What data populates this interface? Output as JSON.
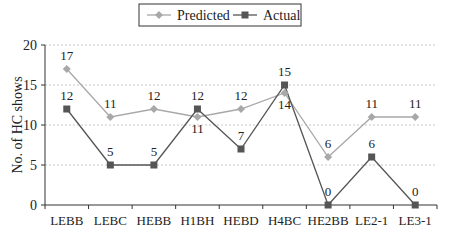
{
  "chart_data": {
    "type": "line",
    "title": "",
    "xlabel": "",
    "ylabel": "No. of HC shows",
    "ylim": [
      0,
      20
    ],
    "yticks": [
      0,
      5,
      10,
      15,
      20
    ],
    "grid": true,
    "legend_position": "top-center",
    "categories": [
      "LEBB",
      "LEBC",
      "HEBB",
      "H1BH",
      "HEBD",
      "H4BC",
      "HE2BB",
      "LE2-1",
      "LE3-1"
    ],
    "series": [
      {
        "name": "Predicted",
        "values": [
          17,
          11,
          12,
          11,
          12,
          14,
          6,
          11,
          11
        ],
        "color": "#a8a8a8",
        "marker": "diamond"
      },
      {
        "name": "Actual",
        "values": [
          12,
          5,
          5,
          12,
          7,
          15,
          0,
          6,
          0
        ],
        "color": "#555555",
        "marker": "square"
      }
    ]
  }
}
